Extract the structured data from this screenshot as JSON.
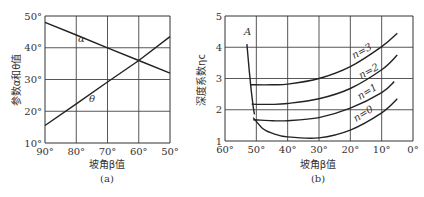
{
  "chart_data": [
    {
      "type": "line",
      "panel_label": "(a)",
      "title": "",
      "xlabel": "坡角β值",
      "ylabel": "参数α和θ值",
      "x": [
        90,
        80,
        70,
        60,
        50
      ],
      "xlim": [
        90,
        50
      ],
      "ylim": [
        10,
        50
      ],
      "x_ticks": [
        "90°",
        "80°",
        "70°",
        "60°",
        "50°"
      ],
      "y_ticks": [
        "10°",
        "20°",
        "30°",
        "40°",
        "50°"
      ],
      "grid": true,
      "series": [
        {
          "name": "α",
          "values": [
            48,
            44,
            40,
            36,
            32
          ]
        },
        {
          "name": "θ",
          "values": [
            15.5,
            22.3,
            29.2,
            36,
            43.5
          ]
        }
      ]
    },
    {
      "type": "line",
      "panel_label": "(b)",
      "title": "",
      "xlabel": "坡角β值",
      "ylabel": "深度系数ηc",
      "xlim": [
        60,
        0
      ],
      "ylim": [
        1,
        5
      ],
      "x_ticks": [
        "60°",
        "50°",
        "40°",
        "30°",
        "20°",
        "10°",
        "0°"
      ],
      "y_ticks": [
        "1",
        "2",
        "3",
        "4",
        "5"
      ],
      "grid": true,
      "series": [
        {
          "name": "A",
          "x": [
            53,
            52.3,
            51.6,
            51,
            50.6
          ],
          "values": [
            4.1,
            3.3,
            2.6,
            2.1,
            1.85
          ]
        },
        {
          "name": "n=3",
          "x": [
            52,
            45,
            40,
            30,
            20,
            10,
            5
          ],
          "values": [
            2.8,
            2.8,
            2.82,
            3.0,
            3.38,
            4.02,
            4.45
          ]
        },
        {
          "name": "n=2",
          "x": [
            51.5,
            45,
            40,
            30,
            20,
            10,
            5
          ],
          "values": [
            2.18,
            2.17,
            2.2,
            2.35,
            2.68,
            3.28,
            3.75
          ]
        },
        {
          "name": "n=1",
          "x": [
            51,
            45,
            40,
            30,
            20,
            10,
            6
          ],
          "values": [
            1.68,
            1.65,
            1.65,
            1.75,
            2.05,
            2.55,
            2.9
          ]
        },
        {
          "name": "n=0",
          "x": [
            51,
            48,
            45,
            40,
            30,
            20,
            10,
            5
          ],
          "values": [
            1.75,
            1.4,
            1.25,
            1.13,
            1.1,
            1.35,
            1.9,
            2.35
          ]
        }
      ],
      "annotations": [
        "A",
        "n=3",
        "n=2",
        "n=1",
        "n=0"
      ]
    }
  ]
}
